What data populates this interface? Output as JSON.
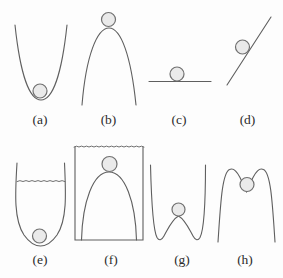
{
  "figure": {
    "panels": [
      {
        "id": "a",
        "label": "(a)"
      },
      {
        "id": "b",
        "label": "(b)"
      },
      {
        "id": "c",
        "label": "(c)"
      },
      {
        "id": "d",
        "label": "(d)"
      },
      {
        "id": "e",
        "label": "(e)"
      },
      {
        "id": "f",
        "label": "(f)"
      },
      {
        "id": "g",
        "label": "(g)"
      },
      {
        "id": "h",
        "label": "(h)"
      }
    ],
    "colors": {
      "background": "#fdfdfd",
      "curve": "#5f5f5f",
      "ball_fill": "#eaeaea",
      "ball_stroke": "#707070",
      "label": "#2b2b2b"
    }
  }
}
